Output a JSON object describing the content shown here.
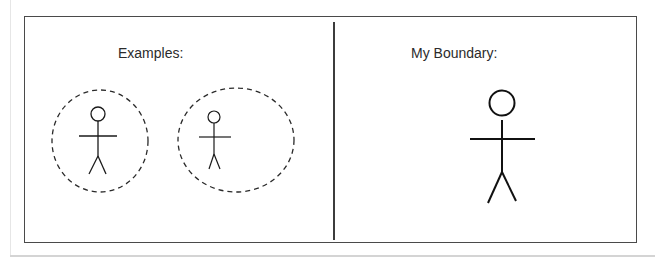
{
  "diagram": {
    "panels": [
      {
        "id": "examples",
        "label": "Examples:",
        "figures": [
          {
            "type": "stick-figure",
            "size": "small",
            "boundary": "dashed-circle"
          },
          {
            "type": "stick-figure",
            "size": "small",
            "boundary": "dashed-ellipse"
          }
        ]
      },
      {
        "id": "my-boundary",
        "label": "My Boundary:",
        "figures": [
          {
            "type": "stick-figure",
            "size": "large",
            "boundary": "none"
          }
        ]
      }
    ],
    "colors": {
      "stroke": "#1a1a1a",
      "frame": "#4a4a4a",
      "text": "#2b2b2b",
      "background": "#ffffff"
    }
  }
}
